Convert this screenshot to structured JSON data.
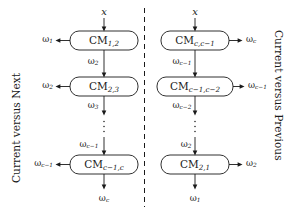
{
  "figure": {
    "name": "classifier-module-chain-diagram",
    "divider": "dashed-vertical-separator",
    "stroke_color": "#1a1a1a",
    "background_color": "#ffffff"
  },
  "left_panel": {
    "caption": "Current versus Next",
    "input_label": "x",
    "output_label": "ω",
    "output_sub": "c",
    "modules": [
      {
        "name": "CM",
        "sub": "1,2",
        "side_output": {
          "base": "ω",
          "sub": "1"
        },
        "below_link": {
          "base": "ω",
          "sub": "2"
        }
      },
      {
        "name": "CM",
        "sub": "2,3",
        "side_output": {
          "base": "ω",
          "sub": "2"
        },
        "below_link": {
          "base": "ω",
          "sub": "3"
        }
      },
      {
        "name": "CM",
        "sub": "c−1,c",
        "side_output": {
          "base": "ω",
          "sub": "c−1"
        },
        "above_link": {
          "base": "ω",
          "sub": "c−1"
        }
      }
    ],
    "ellipsis": "vertical-dots"
  },
  "right_panel": {
    "caption": "Current versus Previous",
    "input_label": "x",
    "output_label": "ω",
    "output_sub": "1",
    "modules": [
      {
        "name": "CM",
        "sub": "c,c−1",
        "side_output": {
          "base": "ω",
          "sub": "c"
        },
        "below_link": {
          "base": "ω",
          "sub": "c−1"
        }
      },
      {
        "name": "CM",
        "sub": "c−1,c−2",
        "side_output": {
          "base": "ω",
          "sub": "c−1"
        },
        "below_link": {
          "base": "ω",
          "sub": "c−2"
        }
      },
      {
        "name": "CM",
        "sub": "2,1",
        "side_output": {
          "base": "ω",
          "sub": "2"
        },
        "above_link": {
          "base": "ω",
          "sub": "2"
        }
      }
    ],
    "ellipsis": "vertical-dots"
  }
}
